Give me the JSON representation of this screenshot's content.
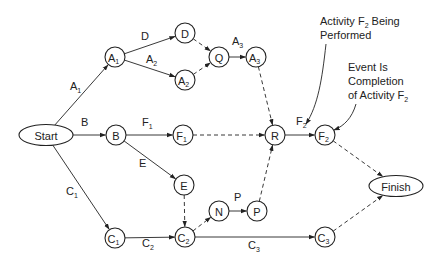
{
  "diagram": {
    "type": "activity-on-arrow network (PERT)",
    "nodes": [
      {
        "id": "start",
        "label": "Start",
        "sub": "",
        "shape": "ellipse",
        "x": 46,
        "y": 135
      },
      {
        "id": "A1",
        "label": "A",
        "sub": "1",
        "shape": "circle",
        "x": 115,
        "y": 57
      },
      {
        "id": "D",
        "label": "D",
        "sub": "",
        "shape": "circle",
        "x": 185,
        "y": 33
      },
      {
        "id": "A2",
        "label": "A",
        "sub": "2",
        "shape": "circle",
        "x": 185,
        "y": 80
      },
      {
        "id": "Q",
        "label": "Q",
        "sub": "",
        "shape": "circle",
        "x": 219,
        "y": 57
      },
      {
        "id": "A3",
        "label": "A",
        "sub": "3",
        "shape": "circle",
        "x": 256,
        "y": 57
      },
      {
        "id": "B",
        "label": "B",
        "sub": "",
        "shape": "circle",
        "x": 116,
        "y": 135
      },
      {
        "id": "F1",
        "label": "F",
        "sub": "1",
        "shape": "circle",
        "x": 183,
        "y": 135
      },
      {
        "id": "R",
        "label": "R",
        "sub": "",
        "shape": "circle",
        "x": 275,
        "y": 135
      },
      {
        "id": "F2",
        "label": "F",
        "sub": "2",
        "shape": "circle",
        "x": 325,
        "y": 135
      },
      {
        "id": "E",
        "label": "E",
        "sub": "",
        "shape": "circle",
        "x": 184,
        "y": 185
      },
      {
        "id": "C1",
        "label": "C",
        "sub": "1",
        "shape": "circle",
        "x": 115,
        "y": 238
      },
      {
        "id": "C2",
        "label": "C",
        "sub": "2",
        "shape": "circle",
        "x": 185,
        "y": 237
      },
      {
        "id": "N",
        "label": "N",
        "sub": "",
        "shape": "circle",
        "x": 219,
        "y": 211
      },
      {
        "id": "P",
        "label": "P",
        "sub": "",
        "shape": "circle",
        "x": 257,
        "y": 211
      },
      {
        "id": "C3",
        "label": "C",
        "sub": "3",
        "shape": "circle",
        "x": 325,
        "y": 237
      },
      {
        "id": "finish",
        "label": "Finish",
        "sub": "",
        "shape": "ellipse",
        "x": 396,
        "y": 186
      }
    ],
    "edges": [
      {
        "from": "start",
        "to": "A1",
        "label": "A",
        "sub": "1",
        "dashed": false,
        "lx": 70,
        "ly": 90
      },
      {
        "from": "A1",
        "to": "D",
        "label": "D",
        "sub": "",
        "dashed": false,
        "lx": 141,
        "ly": 40
      },
      {
        "from": "A1",
        "to": "A2",
        "label": "A",
        "sub": "2",
        "dashed": false,
        "lx": 146,
        "ly": 63
      },
      {
        "from": "D",
        "to": "Q",
        "label": "",
        "sub": "",
        "dashed": true
      },
      {
        "from": "A2",
        "to": "Q",
        "label": "",
        "sub": "",
        "dashed": true
      },
      {
        "from": "Q",
        "to": "A3",
        "label": "A",
        "sub": "3",
        "dashed": false,
        "lx": 232,
        "ly": 45
      },
      {
        "from": "start",
        "to": "B",
        "label": "B",
        "sub": "",
        "dashed": false,
        "lx": 81,
        "ly": 126
      },
      {
        "from": "B",
        "to": "F1",
        "label": "F",
        "sub": "1",
        "dashed": false,
        "lx": 142,
        "ly": 126
      },
      {
        "from": "F1",
        "to": "R",
        "label": "",
        "sub": "",
        "dashed": true
      },
      {
        "from": "A3",
        "to": "R",
        "label": "",
        "sub": "",
        "dashed": true
      },
      {
        "from": "R",
        "to": "F2",
        "label": "F",
        "sub": "2",
        "dashed": false,
        "lx": 296,
        "ly": 125
      },
      {
        "from": "B",
        "to": "E",
        "label": "E",
        "sub": "",
        "dashed": false,
        "lx": 139,
        "ly": 167
      },
      {
        "from": "E",
        "to": "C2",
        "label": "",
        "sub": "",
        "dashed": true
      },
      {
        "from": "start",
        "to": "C1",
        "label": "C",
        "sub": "1",
        "dashed": false,
        "lx": 66,
        "ly": 195
      },
      {
        "from": "C1",
        "to": "C2",
        "label": "C",
        "sub": "2",
        "dashed": false,
        "lx": 142,
        "ly": 247
      },
      {
        "from": "C2",
        "to": "N",
        "label": "",
        "sub": "",
        "dashed": true
      },
      {
        "from": "N",
        "to": "P",
        "label": "P",
        "sub": "",
        "dashed": false,
        "lx": 234,
        "ly": 201
      },
      {
        "from": "P",
        "to": "R",
        "label": "",
        "sub": "",
        "dashed": true
      },
      {
        "from": "C2",
        "to": "C3",
        "label": "C",
        "sub": "3",
        "dashed": false,
        "lx": 248,
        "ly": 249
      },
      {
        "from": "F2",
        "to": "finish",
        "label": "",
        "sub": "",
        "dashed": true
      },
      {
        "from": "C3",
        "to": "finish",
        "label": "",
        "sub": "",
        "dashed": true
      }
    ],
    "annotations": [
      {
        "id": "activity-note",
        "lines": [
          "Activity F",
          "2",
          " Being",
          "Performed"
        ],
        "line1_text": "Activity F",
        "line1_sub": "2",
        "line1_rest": " Being",
        "line2": "Performed",
        "x": 320,
        "y": 25
      },
      {
        "id": "event-note",
        "line1": "Event Is",
        "line2": "Completion",
        "line3_text": "of Activity F",
        "line3_sub": "2",
        "x": 348,
        "y": 71
      }
    ]
  }
}
